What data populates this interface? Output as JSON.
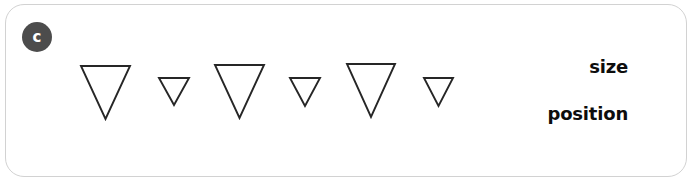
{
  "panel": {
    "badge_label": "c",
    "badge_color": "#4c4c4c",
    "badge_text_color": "#ffffff",
    "border_color": "#d2d2d2",
    "background_color": "#ffffff"
  },
  "labels": {
    "size": "size",
    "position": "position",
    "text_color": "#0d0d0d"
  },
  "chart_data": {
    "type": "scatter",
    "title": "",
    "xlabel": "",
    "ylabel": "",
    "annotations": [
      "size",
      "position"
    ],
    "marker_shape": "downward-triangle",
    "marker_stroke": "#262626",
    "marker_fill": "none",
    "categories": [
      "triangle-1",
      "triangle-2",
      "triangle-3",
      "triangle-4",
      "triangle-5",
      "triangle-6"
    ],
    "series": [
      {
        "name": "width",
        "values": [
          49,
          30,
          49,
          30,
          48,
          29
        ]
      },
      {
        "name": "height",
        "values": [
          53,
          27,
          53,
          28,
          53,
          28
        ]
      },
      {
        "name": "top_y",
        "values": [
          66,
          78,
          65,
          78,
          64,
          78
        ]
      },
      {
        "name": "left_x",
        "values": [
          81,
          159,
          215,
          290,
          347,
          424
        ]
      }
    ],
    "markers": [
      {
        "name": "triangle-1",
        "left": 81,
        "top": 66,
        "width": 49,
        "height": 53,
        "size_class": "large"
      },
      {
        "name": "triangle-2",
        "left": 159,
        "top": 78,
        "width": 30,
        "height": 27,
        "size_class": "small"
      },
      {
        "name": "triangle-3",
        "left": 215,
        "top": 65,
        "width": 49,
        "height": 53,
        "size_class": "large"
      },
      {
        "name": "triangle-4",
        "left": 290,
        "top": 78,
        "width": 30,
        "height": 28,
        "size_class": "small"
      },
      {
        "name": "triangle-5",
        "left": 347,
        "top": 64,
        "width": 48,
        "height": 53,
        "size_class": "large"
      },
      {
        "name": "triangle-6",
        "left": 424,
        "top": 78,
        "width": 29,
        "height": 28,
        "size_class": "small"
      }
    ]
  }
}
